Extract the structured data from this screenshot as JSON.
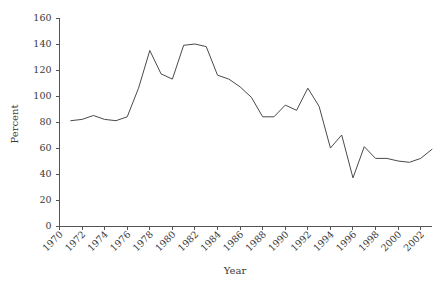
{
  "chart_data": {
    "type": "line",
    "title": "",
    "xlabel": "Year",
    "ylabel": "Percent",
    "xlim": [
      1970,
      2003
    ],
    "ylim": [
      0,
      160
    ],
    "grid": false,
    "legend": null,
    "yticks": [
      0,
      20,
      40,
      60,
      80,
      100,
      120,
      140,
      160
    ],
    "xticks": [
      1970,
      1972,
      1974,
      1976,
      1978,
      1980,
      1982,
      1984,
      1986,
      1988,
      1990,
      1992,
      1994,
      1996,
      1998,
      2000,
      2002
    ],
    "xtick_labels": [
      "1970",
      "1972",
      "1974",
      "1976",
      "1978",
      "1980",
      "1982",
      "1984",
      "1986",
      "1988",
      "1990",
      "1992",
      "1994",
      "1996",
      "1998",
      "2000",
      "2002"
    ],
    "ytick_labels": [
      "0",
      "20",
      "40",
      "60",
      "80",
      "100",
      "120",
      "140",
      "160"
    ],
    "series": [
      {
        "name": "Percent",
        "color": "#4a4a4a",
        "x": [
          1971,
          1972,
          1973,
          1974,
          1975,
          1976,
          1977,
          1978,
          1979,
          1980,
          1981,
          1982,
          1983,
          1984,
          1985,
          1986,
          1987,
          1988,
          1989,
          1990,
          1991,
          1992,
          1993,
          1994,
          1995,
          1996,
          1997,
          1998,
          1999,
          2000,
          2001,
          2002,
          2003
        ],
        "values": [
          81,
          82,
          85,
          82,
          81,
          84,
          106,
          135,
          117,
          113,
          139,
          140,
          138,
          116,
          113,
          107,
          99,
          84,
          84,
          93,
          89,
          106,
          92,
          60,
          70,
          37,
          61,
          52,
          52,
          50,
          49,
          52,
          59
        ]
      }
    ]
  }
}
